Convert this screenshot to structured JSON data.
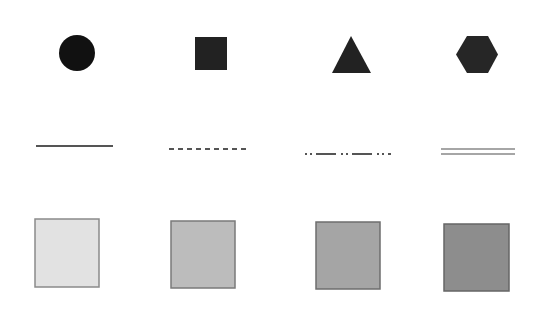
{
  "canvas": {
    "width": 546,
    "height": 312,
    "background": "#ffffff"
  },
  "shapes": [
    {
      "name": "circle",
      "fill": "#111111",
      "cx": 77,
      "cy": 53,
      "r": 18
    },
    {
      "name": "square",
      "fill": "#222222",
      "x": 195,
      "y": 37,
      "w": 32,
      "h": 33
    },
    {
      "name": "triangle",
      "fill": "#222222",
      "points": "351,36 371,73 332,73"
    },
    {
      "name": "hexagon",
      "fill": "#262626",
      "points": "467,36 488,36 498,54.5 488,73 467,73 456,54.5"
    }
  ],
  "lines": [
    {
      "name": "solid-line",
      "style": "solid",
      "color": "#555555",
      "x1": 36,
      "x2": 113,
      "y": 146,
      "width": 2,
      "dash": ""
    },
    {
      "name": "dashed-line",
      "style": "dashed",
      "color": "#555555",
      "x1": 169,
      "x2": 248,
      "y": 149,
      "width": 2,
      "dash": "5,4"
    },
    {
      "name": "dash-dot-dot-line",
      "style": "dash-dot-dot",
      "color": "#555555",
      "x1": 305,
      "x2": 391,
      "y": 154,
      "width": 2,
      "dash": "2,3,2,4,20,5,2,3,2,4,20,5"
    },
    {
      "name": "double-line",
      "style": "double",
      "color": "#888888",
      "x1": 441,
      "x2": 515,
      "y1": 149,
      "y2": 154,
      "width": 1.5
    }
  ],
  "fills": [
    {
      "name": "fill-square-lightest",
      "fill": "#e2e2e2",
      "stroke": "#8a8a8a",
      "x": 35,
      "y": 219,
      "w": 64,
      "h": 68
    },
    {
      "name": "fill-square-light",
      "fill": "#bcbcbc",
      "stroke": "#7a7a7a",
      "x": 171,
      "y": 221,
      "w": 64,
      "h": 67
    },
    {
      "name": "fill-square-medium",
      "fill": "#a5a5a5",
      "stroke": "#6e6e6e",
      "x": 316,
      "y": 222,
      "w": 64,
      "h": 67
    },
    {
      "name": "fill-square-dark",
      "fill": "#8d8d8d",
      "stroke": "#666666",
      "x": 444,
      "y": 224,
      "w": 65,
      "h": 67
    }
  ]
}
